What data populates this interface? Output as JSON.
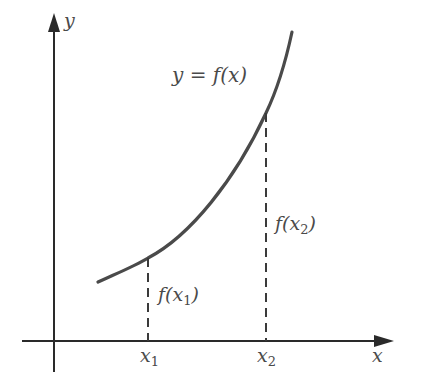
{
  "diagram": {
    "axes": {
      "x_label": "x",
      "y_label": "y"
    },
    "curve_label": "y = f(x)",
    "points": [
      {
        "x_label_base": "x",
        "x_label_sub": "1",
        "value_label_pre": "f(x",
        "value_label_sub": "1",
        "value_label_post": ")"
      },
      {
        "x_label_base": "x",
        "x_label_sub": "2",
        "value_label_pre": "f(x",
        "value_label_sub": "2",
        "value_label_post": ")"
      }
    ],
    "colors": {
      "axis": "#2a2a2a",
      "curve": "#4a4a4a",
      "dashed": "#3a3a3a",
      "text": "#4a4a4a",
      "background": "#ffffff"
    }
  }
}
